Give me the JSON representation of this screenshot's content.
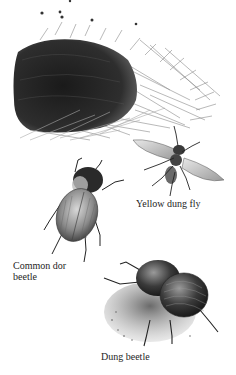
{
  "illustration": {
    "subjects": [
      {
        "id": "dung-pat",
        "description": "dung pat in grass"
      },
      {
        "id": "yellow-dung-fly",
        "label": "Yellow dung fly"
      },
      {
        "id": "common-dor-beetle",
        "label_line1": "Common dor",
        "label_line2": "beetle"
      },
      {
        "id": "dung-beetle",
        "label": "Dung beetle"
      }
    ]
  },
  "labels": {
    "yellow_dung_fly": "Yellow dung fly",
    "common_dor_line1": "Common dor",
    "common_dor_line2": "beetle",
    "dung_beetle": "Dung beetle"
  },
  "colors": {
    "ink": "#1e1e1e",
    "dark": "#2a2a2a",
    "mid": "#707070",
    "light": "#b8b8b8",
    "paper": "#ffffff"
  }
}
